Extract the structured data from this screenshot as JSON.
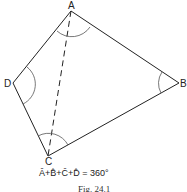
{
  "figure": {
    "vertices": {
      "A": "A",
      "B": "B",
      "C": "C",
      "D": "D"
    },
    "formula": "Â+B̂+Ĉ+D̂ = 360°",
    "caption": "Fig. 24.1"
  },
  "colors": {
    "line": "#222222",
    "arc": "#444444",
    "background": "#ffffff"
  }
}
